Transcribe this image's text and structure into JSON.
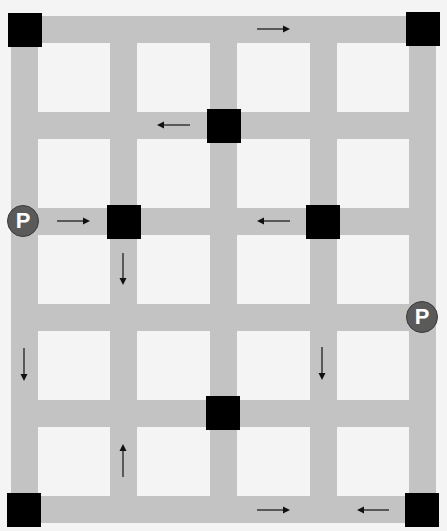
{
  "diagram": {
    "title": "",
    "colors": {
      "background": "#f4f4f4",
      "road": "#c3c3c3",
      "block": "#000000",
      "parking": "#5a5a5a",
      "arrow": "#111111"
    },
    "vertical_roads": [
      {
        "x": 11,
        "width": 27
      },
      {
        "x": 110,
        "width": 27
      },
      {
        "x": 210,
        "width": 27
      },
      {
        "x": 310,
        "width": 27
      },
      {
        "x": 409,
        "width": 27
      }
    ],
    "horizontal_roads": [
      {
        "y": 16,
        "height": 27
      },
      {
        "y": 112,
        "height": 27
      },
      {
        "y": 208,
        "height": 27
      },
      {
        "y": 304,
        "height": 27
      },
      {
        "y": 400,
        "height": 27
      },
      {
        "y": 496,
        "height": 27
      }
    ],
    "blocks": [
      {
        "id": "block-top-left",
        "x": 8,
        "y": 13
      },
      {
        "id": "block-top-right",
        "x": 406,
        "y": 12
      },
      {
        "id": "block-row2-col3",
        "x": 207,
        "y": 109
      },
      {
        "id": "block-row3-col2",
        "x": 107,
        "y": 205
      },
      {
        "id": "block-row3-col4",
        "x": 306,
        "y": 205
      },
      {
        "id": "block-row5-col3",
        "x": 206,
        "y": 396
      },
      {
        "id": "block-bottom-left",
        "x": 7,
        "y": 493
      },
      {
        "id": "block-bottom-right",
        "x": 405,
        "y": 493
      }
    ],
    "parking": [
      {
        "id": "parking-left",
        "label": "P",
        "x": 7,
        "y": 205
      },
      {
        "id": "parking-right",
        "label": "P",
        "x": 406,
        "y": 301
      }
    ],
    "arrows": [
      {
        "id": "arrow-top-right",
        "direction": "right",
        "x1": 257,
        "y1": 29,
        "x2": 290,
        "y2": 29
      },
      {
        "id": "arrow-row2-left",
        "direction": "left",
        "x1": 190,
        "y1": 125,
        "x2": 157,
        "y2": 125
      },
      {
        "id": "arrow-row3-right",
        "direction": "right",
        "x1": 57,
        "y1": 221,
        "x2": 90,
        "y2": 221
      },
      {
        "id": "arrow-row3-left",
        "direction": "left",
        "x1": 290,
        "y1": 221,
        "x2": 257,
        "y2": 221
      },
      {
        "id": "arrow-col2-down",
        "direction": "down",
        "x1": 123,
        "y1": 253,
        "x2": 123,
        "y2": 285
      },
      {
        "id": "arrow-col1-down",
        "direction": "down",
        "x1": 24,
        "y1": 348,
        "x2": 24,
        "y2": 381
      },
      {
        "id": "arrow-col4-down",
        "direction": "down",
        "x1": 322,
        "y1": 347,
        "x2": 322,
        "y2": 380
      },
      {
        "id": "arrow-col2-up",
        "direction": "up",
        "x1": 123,
        "y1": 477,
        "x2": 123,
        "y2": 444
      },
      {
        "id": "arrow-bottom-right",
        "direction": "right",
        "x1": 257,
        "y1": 510,
        "x2": 290,
        "y2": 510
      },
      {
        "id": "arrow-bottom-left",
        "direction": "left",
        "x1": 389,
        "y1": 510,
        "x2": 357,
        "y2": 510
      }
    ]
  }
}
